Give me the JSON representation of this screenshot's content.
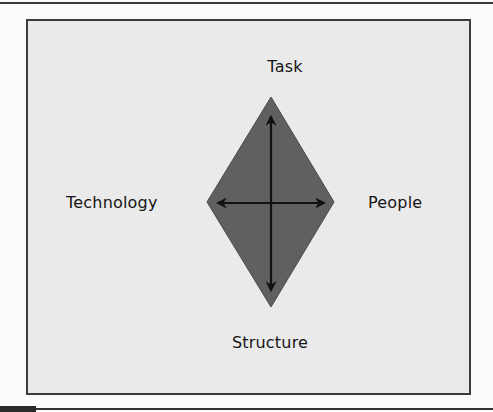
{
  "diagram": {
    "type": "leavitt-diamond",
    "labels": {
      "top": "Task",
      "left": "Technology",
      "right": "People",
      "bottom": "Structure"
    },
    "colors": {
      "frame_background": "#eaeaea",
      "frame_border": "#3c3c3c",
      "diamond_fill": "#606060",
      "diamond_stroke": "#4a4a4a",
      "arrow": "#111111",
      "text": "#151515"
    },
    "arrows": [
      {
        "orientation": "vertical",
        "heads": [
          "up",
          "down"
        ]
      },
      {
        "orientation": "horizontal",
        "heads": [
          "left",
          "right"
        ]
      }
    ]
  }
}
